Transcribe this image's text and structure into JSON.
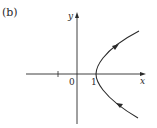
{
  "figure": {
    "panel_label": "(b)",
    "x_axis_label": "x",
    "y_axis_label": "y",
    "origin_label": "0",
    "vertex_label": "1",
    "curve": "right-opening branch with vertex at (1, 0)",
    "direction": "lower branch traversed toward vertex, upper branch away from vertex",
    "colors": {
      "ink": "#2a2a2a",
      "background": "#ffffff"
    }
  }
}
